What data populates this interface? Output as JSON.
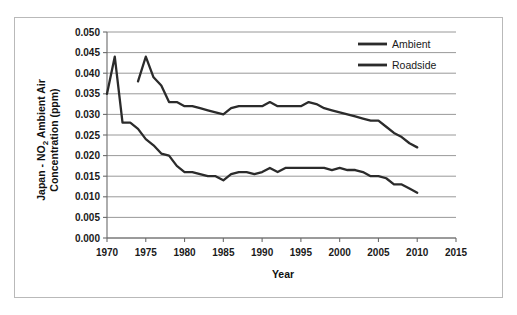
{
  "figure": {
    "border_color": "#b9b9b9",
    "background": "#ffffff"
  },
  "chart_data": {
    "type": "line",
    "title": "",
    "xlabel": "Year",
    "ylabel": "Japan - NO₂ Ambient Air Concentration (ppm)",
    "ylabel_line1": "Japan - NO",
    "ylabel_sub": "2",
    "ylabel_line1_tail": " Ambient Air",
    "ylabel_line2": "Concentration (ppm)",
    "xlim": [
      1970,
      2015
    ],
    "ylim": [
      0.0,
      0.05
    ],
    "grid": "horizontal",
    "legend_position": "top-right",
    "xticks": [
      1970,
      1975,
      1980,
      1985,
      1990,
      1995,
      2000,
      2005,
      2010,
      2015
    ],
    "xtick_labels": [
      "1970",
      "1975",
      "1980",
      "1985",
      "1990",
      "1995",
      "2000",
      "2005",
      "2010",
      "2015"
    ],
    "yticks": [
      0.0,
      0.005,
      0.01,
      0.015,
      0.02,
      0.025,
      0.03,
      0.035,
      0.04,
      0.045,
      0.05
    ],
    "ytick_labels": [
      "0.000",
      "0.005",
      "0.010",
      "0.015",
      "0.020",
      "0.025",
      "0.030",
      "0.035",
      "0.040",
      "0.045",
      "0.050"
    ],
    "series": [
      {
        "name": "Roadside",
        "color": "#2b2b2b",
        "x": [
          1974,
          1975,
          1976,
          1977,
          1978,
          1979,
          1980,
          1981,
          1982,
          1983,
          1984,
          1985,
          1986,
          1987,
          1988,
          1989,
          1990,
          1991,
          1992,
          1993,
          1994,
          1995,
          1996,
          1997,
          1998,
          1999,
          2000,
          2001,
          2002,
          2003,
          2004,
          2005,
          2006,
          2007,
          2008,
          2009,
          2010
        ],
        "values": [
          0.038,
          0.044,
          0.039,
          0.037,
          0.033,
          0.033,
          0.032,
          0.032,
          0.0315,
          0.031,
          0.0305,
          0.03,
          0.0315,
          0.032,
          0.032,
          0.032,
          0.032,
          0.033,
          0.032,
          0.032,
          0.032,
          0.032,
          0.033,
          0.0325,
          0.0315,
          0.031,
          0.0305,
          0.03,
          0.0295,
          0.029,
          0.0285,
          0.0285,
          0.027,
          0.0255,
          0.0245,
          0.023,
          0.022
        ]
      },
      {
        "name": "Ambient",
        "color": "#2b2b2b",
        "x": [
          1970,
          1971,
          1972,
          1973,
          1974,
          1975,
          1976,
          1977,
          1978,
          1979,
          1980,
          1981,
          1982,
          1983,
          1984,
          1985,
          1986,
          1987,
          1988,
          1989,
          1990,
          1991,
          1992,
          1993,
          1994,
          1995,
          1996,
          1997,
          1998,
          1999,
          2000,
          2001,
          2002,
          2003,
          2004,
          2005,
          2006,
          2007,
          2008,
          2009,
          2010
        ],
        "values": [
          0.035,
          0.044,
          0.028,
          0.028,
          0.0265,
          0.024,
          0.0225,
          0.0205,
          0.02,
          0.0175,
          0.016,
          0.016,
          0.0155,
          0.015,
          0.015,
          0.014,
          0.0155,
          0.016,
          0.016,
          0.0155,
          0.016,
          0.017,
          0.016,
          0.017,
          0.017,
          0.017,
          0.017,
          0.017,
          0.017,
          0.0165,
          0.017,
          0.0165,
          0.0165,
          0.016,
          0.015,
          0.015,
          0.0145,
          0.013,
          0.013,
          0.012,
          0.011
        ]
      }
    ],
    "legend_entries": [
      {
        "label": "Ambient",
        "color": "#2b2b2b"
      },
      {
        "label": "Roadside",
        "color": "#2b2b2b"
      }
    ]
  }
}
